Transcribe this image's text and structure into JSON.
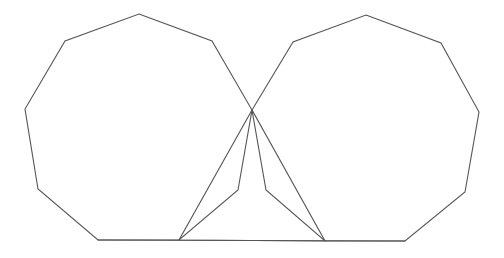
{
  "diagram": {
    "stroke_color": "#555555",
    "background_color": "#ffffff",
    "shapes": [
      {
        "id": "left-nonagon",
        "type": "polygon",
        "sides": 9,
        "points": [
          [
            139,
            14
          ],
          [
            212,
            41
          ],
          [
            252,
            110
          ],
          [
            238,
            190
          ],
          [
            179,
            240
          ],
          [
            98,
            240
          ],
          [
            38,
            189
          ],
          [
            25,
            109
          ],
          [
            65,
            41
          ]
        ]
      },
      {
        "id": "right-nonagon",
        "type": "polygon",
        "sides": 9,
        "points": [
          [
            366,
            15
          ],
          [
            441,
            43
          ],
          [
            479,
            112
          ],
          [
            465,
            192
          ],
          [
            405,
            241
          ],
          [
            325,
            241
          ],
          [
            266,
            190
          ],
          [
            252,
            110
          ],
          [
            293,
            42
          ]
        ]
      },
      {
        "id": "center-triangle",
        "type": "polygon",
        "sides": 3,
        "points": [
          [
            252,
            110
          ],
          [
            179,
            240
          ],
          [
            325,
            241
          ]
        ]
      },
      {
        "id": "base-line",
        "type": "line",
        "points": [
          [
            98,
            240
          ],
          [
            405,
            241
          ]
        ]
      }
    ],
    "shared_vertex": [
      252,
      110
    ]
  }
}
